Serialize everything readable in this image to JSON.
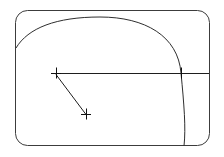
{
  "drawing": {
    "title": "Geometric line drawing",
    "background_color": "#ffffff",
    "canvas": {
      "width": 224,
      "height": 157
    },
    "frame": {
      "name": "rounded-rectangle-border",
      "x": 15.5,
      "y": 10.5,
      "width": 194,
      "height": 135,
      "corner_radius": 12,
      "stroke_color": "#3c3c3c",
      "stroke_width": 1
    },
    "arc": {
      "name": "large-elliptical-arc",
      "description": "Large arc entering at left border and exiting through bottom border",
      "start_point": {
        "x": 16,
        "y": 48
      },
      "end_point": {
        "x": 184,
        "y": 146
      },
      "apex_point": {
        "x": 100,
        "y": 17
      },
      "right_extreme": {
        "x": 181,
        "y": 73
      },
      "stroke_color": "#2e2e2e",
      "stroke_width": 1
    },
    "horizontal_line": {
      "name": "horizontal-construction-line",
      "start": {
        "x": 57,
        "y": 73
      },
      "end": {
        "x": 209,
        "y": 73
      },
      "stroke_color": "#1e1e1e",
      "stroke_width": 1
    },
    "diagonal_line": {
      "name": "diagonal-connector-line",
      "start": {
        "x": 56,
        "y": 74
      },
      "end": {
        "x": 86,
        "y": 114
      },
      "stroke_color": "#1e1e1e",
      "stroke_width": 1
    },
    "markers": [
      {
        "name": "cross-marker-upper-left",
        "type": "cross",
        "x": 56,
        "y": 73,
        "arm_length": 5,
        "stroke_color": "#111111"
      },
      {
        "name": "cross-marker-lower",
        "type": "cross",
        "x": 86,
        "y": 114,
        "arm_length": 5,
        "stroke_color": "#111111"
      },
      {
        "name": "tick-marker-arc-intersection",
        "type": "vertical-tick",
        "x": 181,
        "y": 73,
        "arm_length": 5,
        "stroke_color": "#111111"
      }
    ]
  }
}
